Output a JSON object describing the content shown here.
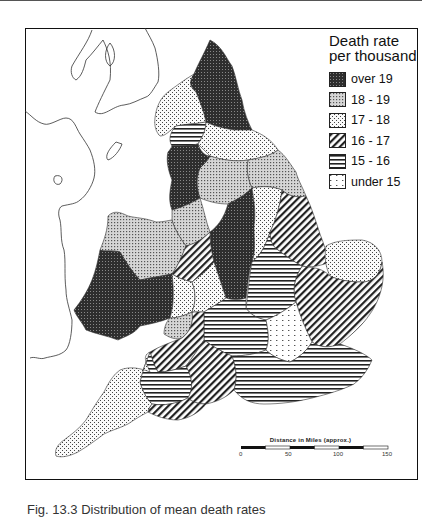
{
  "figure": {
    "caption": "Fig. 13.3 Distribution of mean death rates"
  },
  "legend": {
    "title_line1": "Death rate",
    "title_line2": "per thousand",
    "items": [
      {
        "label": "over 19",
        "pattern": "solid-dark"
      },
      {
        "label": "18 - 19",
        "pattern": "dense-dots"
      },
      {
        "label": "17 - 18",
        "pattern": "sparse-dots"
      },
      {
        "label": "16 - 17",
        "pattern": "diagonal-hatch"
      },
      {
        "label": "15 - 16",
        "pattern": "horizontal-lines"
      },
      {
        "label": "under 15",
        "pattern": "dashed-dots"
      }
    ]
  },
  "scale_bar": {
    "title": "Distance in Miles (approx.)",
    "ticks": [
      "0",
      "50",
      "100",
      "150"
    ]
  },
  "colors": {
    "ink": "#111111",
    "dark_fill": "#3a3a3a",
    "background": "#ffffff"
  }
}
